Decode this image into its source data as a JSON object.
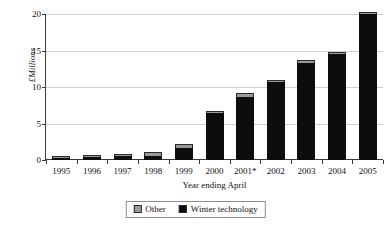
{
  "chart_data": {
    "type": "bar",
    "stacked": true,
    "title": "",
    "subtitle": "",
    "xlabel": "Year ending April",
    "ylabel": "£Millions",
    "categories": [
      "1995",
      "1996",
      "1997",
      "1998",
      "1999",
      "2000",
      "2001*",
      "2002",
      "2003",
      "2004",
      "2005"
    ],
    "series": [
      {
        "name": "Winter technology",
        "color": "#0d0d0d",
        "values": [
          0.3,
          0.35,
          0.5,
          0.6,
          1.6,
          6.4,
          8.7,
          10.7,
          13.3,
          14.5,
          20.0
        ]
      },
      {
        "name": "Other",
        "color": "#9a9a9a",
        "values": [
          0.2,
          0.2,
          0.2,
          0.5,
          0.6,
          0.2,
          0.5,
          0.3,
          0.4,
          0.35,
          0.2
        ]
      }
    ],
    "totals": [
      0.5,
      0.55,
      0.7,
      1.1,
      2.2,
      6.6,
      9.2,
      11.0,
      13.7,
      14.85,
      20.2
    ],
    "ylim": [
      0,
      20
    ],
    "yticks": [
      0,
      5,
      10,
      15,
      20
    ],
    "ytick_labels": [
      "0",
      "5",
      "10",
      "15",
      "20"
    ],
    "grid": true,
    "grid_axis": "y",
    "legend_position": "bottom",
    "legend_entries": [
      "Other",
      "Winter technology"
    ],
    "annotations": [
      "2001 category is marked with an asterisk"
    ]
  }
}
